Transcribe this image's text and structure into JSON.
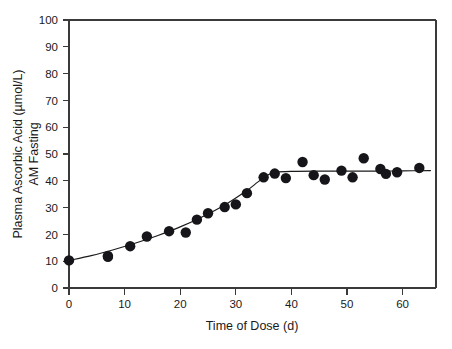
{
  "chart_data": {
    "type": "scatter",
    "title": "",
    "subtitle": "",
    "xlabel": "Time of Dose (d)",
    "ylabel": "Plasma Ascorbic Acid (µmol/L) AM Fasting",
    "ylabel_line1": "Plasma Ascorbic Acid (µmol/L)",
    "ylabel_line2": "AM Fasting",
    "xlim": [
      0,
      66
    ],
    "ylim": [
      0,
      100
    ],
    "xticks": [
      0,
      10,
      20,
      30,
      40,
      50,
      60
    ],
    "yticks": [
      0,
      10,
      20,
      30,
      40,
      50,
      60,
      70,
      80,
      90,
      100
    ],
    "xtick_labels": [
      "0",
      "10",
      "20",
      "30",
      "40",
      "50",
      "60"
    ],
    "ytick_labels": [
      "0",
      "10",
      "20",
      "30",
      "40",
      "50",
      "60",
      "70",
      "80",
      "90",
      "100"
    ],
    "grid": false,
    "legend": null,
    "legend_position": "none",
    "marker": "filled-circle",
    "marker_color": "#16161a",
    "marker_size": 5.2,
    "curve_color": "#1a1a1a",
    "axis_color": "#3a3a3a",
    "background_color": "#ffffff",
    "frame": "box",
    "tick_direction": "out",
    "series": [
      {
        "name": "Plasma ascorbic acid",
        "x": [
          0,
          7,
          7,
          11,
          14,
          18,
          21,
          23,
          25,
          28,
          30,
          32,
          35,
          37,
          39,
          42,
          44,
          46,
          49,
          51,
          53,
          56,
          57,
          59,
          63
        ],
        "y": [
          10.3,
          11.6,
          12.0,
          15.6,
          19.2,
          21.2,
          20.7,
          25.5,
          27.9,
          30.2,
          31.2,
          35.4,
          41.3,
          42.7,
          41.0,
          47.0,
          42.1,
          40.5,
          43.8,
          41.3,
          48.4,
          44.4,
          42.6,
          43.2,
          44.8
        ]
      }
    ],
    "fit_curve": {
      "name": "fitted plateau curve",
      "description": "sigmoid rise to plateau with breakpoint near day 36",
      "x": [
        0,
        4,
        8,
        12,
        16,
        20,
        24,
        28,
        32,
        34,
        36,
        37,
        40,
        45,
        50,
        55,
        60,
        65
      ],
      "y": [
        10.3,
        12.1,
        14.3,
        16.8,
        19.6,
        22.8,
        26.6,
        31.0,
        36.4,
        39.6,
        42.4,
        43.2,
        43.5,
        43.6,
        43.6,
        43.6,
        43.7,
        43.8
      ]
    },
    "annotations": []
  }
}
